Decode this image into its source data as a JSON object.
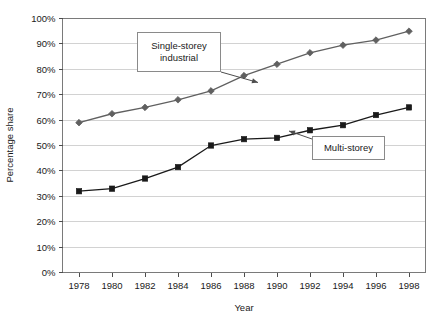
{
  "chart_data": {
    "type": "line",
    "title": "",
    "xlabel": "Year",
    "ylabel": "Percentage share",
    "x": [
      1978,
      1980,
      1982,
      1984,
      1986,
      1988,
      1990,
      1992,
      1994,
      1996,
      1998
    ],
    "xtick_labels": [
      "1978",
      "1980",
      "1982",
      "1984",
      "1986",
      "1988",
      "1990",
      "1992",
      "1994",
      "1996",
      "1998"
    ],
    "xlim": [
      1977,
      1999
    ],
    "ylim": [
      0,
      100
    ],
    "ytick_labels": [
      "0%",
      "10%",
      "20%",
      "30%",
      "40%",
      "50%",
      "60%",
      "70%",
      "80%",
      "90%",
      "100%"
    ],
    "ytick_values": [
      0,
      10,
      20,
      30,
      40,
      50,
      60,
      70,
      80,
      90,
      100
    ],
    "grid": true,
    "legend_position": "inline-annotations",
    "series": [
      {
        "name": "Single-storey industrial",
        "marker": "diamond",
        "color": "#606060",
        "values": [
          59,
          62.5,
          65,
          68,
          71.5,
          77.5,
          82,
          86.5,
          89.5,
          91.5,
          95
        ]
      },
      {
        "name": "Multi-storey",
        "marker": "square",
        "color": "#1a1a1a",
        "values": [
          32,
          33,
          37,
          41.5,
          50,
          52.5,
          53,
          56,
          58,
          62,
          65
        ]
      }
    ],
    "annotations": [
      {
        "text_line1": "Single-storey",
        "text_line2": "industrial",
        "target_series": "Single-storey industrial"
      },
      {
        "text_line1": "Multi-storey",
        "text_line2": "",
        "target_series": "Multi-storey"
      }
    ]
  },
  "axes": {
    "y_title": "Percentage share",
    "x_title": "Year"
  },
  "annotation_labels": {
    "single_storey_line1": "Single-storey",
    "single_storey_line2": "industrial",
    "multi_storey_line1": "Multi-storey"
  },
  "colors": {
    "series_upper": "#606060",
    "series_lower": "#1a1a1a",
    "gridline": "#d2d2d2",
    "frame": "#7a7a7a",
    "text": "#1a1a1a",
    "background": "#ffffff"
  }
}
